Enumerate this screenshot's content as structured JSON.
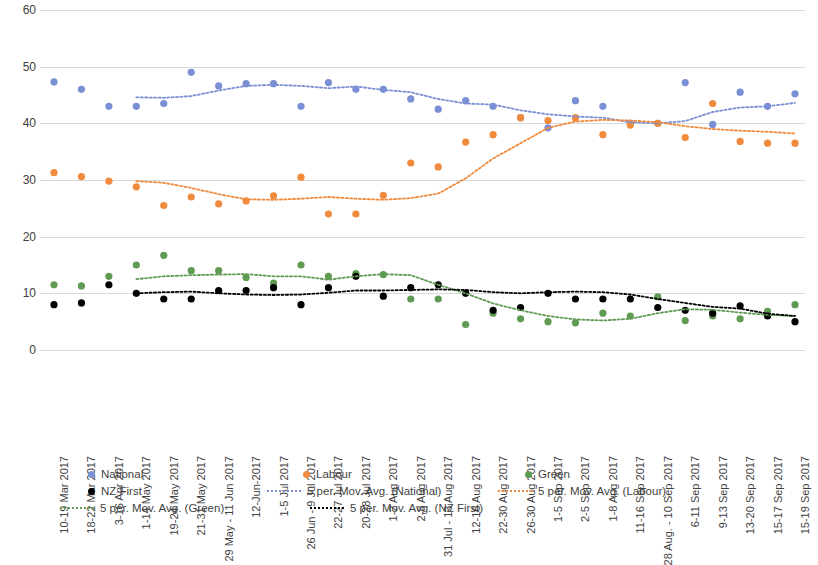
{
  "chart_data": {
    "type": "line",
    "title": "",
    "xlabel": "",
    "ylabel": "",
    "ylim": [
      0,
      60
    ],
    "ytick_labels": [
      "0",
      "10",
      "20",
      "30",
      "40",
      "50",
      "60"
    ],
    "yticks": [
      0,
      10,
      20,
      30,
      40,
      50,
      60
    ],
    "grid": true,
    "legend_position": "bottom",
    "categories": [
      "10-19 Mar 2017",
      "18-22 Mar 2017",
      "3-16 Apr 2017",
      "1-14 May 2017",
      "19-24 May 2017",
      "21-31 May 2017",
      "29 May - 11 Jun 2017",
      "12-Jun-2017",
      "1-5 Jul 2017",
      "26 Jun - 9 Jul 2017",
      "22-27 Jul 2017",
      "20-28 Jul 2017",
      "1-2 Aug 2017",
      "2-8 Aug 2017",
      "31 Jul - 13 Aug 2017",
      "12-16 Aug 2017",
      "22-30 Aug 2017",
      "26-30 Aug 2017",
      "1-5 Sep 2017",
      "2-5 Sep 2017",
      "1-8 Aug 2017",
      "11-16 Sep 2017",
      "28 Aug. - 10 Sep 2017",
      "6-11 Sep 2017",
      "9-13 Sep 2017",
      "13-20 Sep 2017",
      "15-17 Sep 2017",
      "15-19 Sep 2017"
    ],
    "series": [
      {
        "name": "National",
        "style": "scatter",
        "color": "#7b8fd4",
        "values": [
          47.3,
          46.0,
          43.0,
          43.0,
          43.5,
          49.0,
          46.6,
          47.0,
          47.0,
          43.0,
          47.2,
          46.0,
          46.0,
          44.3,
          42.5,
          44.0,
          43.0,
          41.0,
          39.2,
          44.0,
          43.0,
          40.0,
          40.0,
          47.2,
          39.8,
          45.5,
          43.0,
          45.2
        ]
      },
      {
        "name": "Labour",
        "style": "scatter",
        "color": "#f08a3c",
        "values": [
          31.3,
          30.6,
          29.8,
          28.8,
          25.5,
          27.0,
          25.8,
          26.3,
          27.2,
          30.5,
          24.0,
          24.0,
          27.3,
          33.0,
          32.3,
          36.7,
          38.0,
          41.0,
          40.5,
          41.0,
          38.0,
          39.7,
          40.0,
          37.5,
          43.5,
          36.8,
          36.5,
          36.5
        ]
      },
      {
        "name": "Green",
        "style": "scatter",
        "color": "#5f9b52",
        "values": [
          11.5,
          11.3,
          13.0,
          15.0,
          16.7,
          14.0,
          14.0,
          12.8,
          11.8,
          15.0,
          13.0,
          13.5,
          13.3,
          9.0,
          9.0,
          4.5,
          6.5,
          5.5,
          5.0,
          4.8,
          6.5,
          6.0,
          9.4,
          5.2,
          6.0,
          5.5,
          6.8,
          8.0
        ]
      },
      {
        "name": "NZ First",
        "style": "scatter",
        "color": "#000000",
        "values": [
          8.0,
          8.3,
          11.5,
          10.0,
          9.0,
          9.0,
          10.5,
          10.5,
          11.0,
          8.0,
          11.0,
          13.0,
          9.5,
          11.0,
          11.5,
          10.0,
          7.0,
          7.5,
          10.0,
          9.0,
          9.0,
          9.0,
          7.5,
          7.0,
          6.5,
          7.8,
          6.0,
          5.0
        ]
      },
      {
        "name": "5 per. Mov. Avg. (National)",
        "style": "dotted-line",
        "color": "#7b8fd4",
        "values": [
          null,
          null,
          null,
          44.6,
          44.5,
          44.8,
          45.8,
          46.6,
          46.8,
          46.6,
          46.2,
          46.5,
          45.9,
          45.5,
          44.3,
          43.5,
          43.3,
          42.3,
          41.6,
          41.2,
          41.0,
          40.2,
          40.0,
          40.4,
          42.0,
          42.8,
          43.0,
          43.6
        ]
      },
      {
        "name": "5 per. Mov. Avg. (Labour)",
        "style": "dotted-line",
        "color": "#f08a3c",
        "values": [
          null,
          null,
          null,
          29.8,
          29.5,
          28.6,
          27.5,
          26.6,
          26.5,
          26.7,
          27.0,
          26.7,
          26.5,
          26.8,
          27.6,
          30.3,
          33.8,
          36.5,
          39.2,
          40.3,
          40.6,
          40.5,
          40.2,
          39.5,
          39.0,
          38.7,
          38.5,
          38.2
        ]
      },
      {
        "name": "5 per. Mov. Avg. (Green)",
        "style": "dotted-line",
        "color": "#5f9b52",
        "values": [
          null,
          null,
          null,
          12.5,
          13.0,
          13.2,
          13.3,
          13.4,
          13.0,
          13.0,
          12.4,
          13.0,
          13.4,
          13.2,
          11.5,
          10.0,
          8.2,
          7.0,
          6.0,
          5.4,
          5.2,
          5.5,
          6.5,
          7.2,
          7.1,
          6.6,
          6.2,
          6.0
        ]
      },
      {
        "name": "5 per. Mov. Avg. (NZ First)",
        "style": "dotted-line",
        "color": "#000000",
        "values": [
          null,
          null,
          null,
          10.0,
          10.2,
          10.3,
          10.0,
          9.8,
          9.7,
          9.8,
          10.1,
          10.5,
          10.5,
          10.6,
          10.7,
          10.6,
          10.2,
          10.0,
          10.2,
          10.3,
          10.2,
          9.8,
          9.0,
          8.3,
          7.6,
          7.3,
          6.4,
          6.0
        ]
      }
    ]
  },
  "legend": {
    "rows": [
      [
        {
          "label": "National",
          "style": "dot",
          "color": "#7b8fd4",
          "x": 28
        },
        {
          "label": "Labour",
          "style": "dot",
          "color": "#f08a3c",
          "x": 243
        },
        {
          "label": "Green",
          "style": "dot",
          "color": "#5f9b52",
          "x": 465
        }
      ],
      [
        {
          "label": "NZ First",
          "style": "dot",
          "color": "#000000",
          "x": 28
        },
        {
          "label": "5 per. Mov. Avg. (National)",
          "style": "line",
          "color": "#7b8fd4",
          "x": 207
        },
        {
          "label": "5 per. Mov. Avg. (Labour)",
          "style": "line",
          "color": "#f08a3c",
          "x": 438
        }
      ],
      [
        {
          "label": "5 per. Mov. Avg. (Green)",
          "style": "line",
          "color": "#5f9b52",
          "x": 0
        },
        {
          "label": "5 per. Mov. Avg. (NZ First)",
          "style": "line",
          "color": "#000000",
          "x": 250
        }
      ]
    ]
  }
}
